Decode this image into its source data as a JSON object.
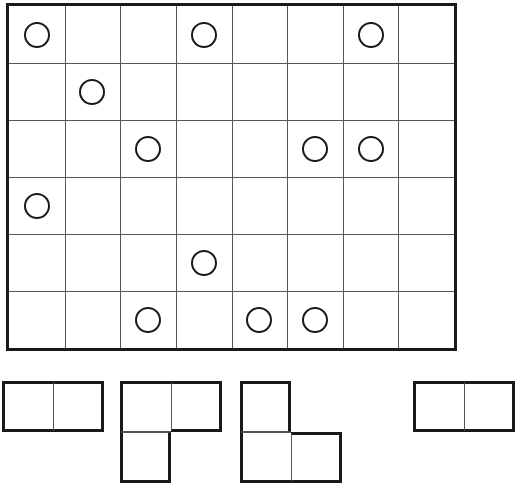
{
  "board": {
    "cols": 8,
    "rows": 6,
    "line_color": "#555555",
    "border_color": "#1a1a1a",
    "circles": [
      {
        "row": 0,
        "col": 0
      },
      {
        "row": 0,
        "col": 3
      },
      {
        "row": 0,
        "col": 6
      },
      {
        "row": 1,
        "col": 1
      },
      {
        "row": 2,
        "col": 2
      },
      {
        "row": 2,
        "col": 5
      },
      {
        "row": 2,
        "col": 6
      },
      {
        "row": 3,
        "col": 0
      },
      {
        "row": 4,
        "col": 3
      },
      {
        "row": 5,
        "col": 2
      },
      {
        "row": 5,
        "col": 4
      },
      {
        "row": 5,
        "col": 5
      }
    ]
  },
  "pieces": [
    {
      "name": "piece-1",
      "left": 2,
      "top": 381,
      "cells": [
        [
          0,
          0
        ],
        [
          0,
          1
        ]
      ]
    },
    {
      "name": "piece-2",
      "left": 120,
      "top": 381,
      "cells": [
        [
          0,
          0
        ],
        [
          1,
          0
        ],
        [
          0,
          1
        ]
      ]
    },
    {
      "name": "piece-3",
      "left": 240,
      "top": 381,
      "cells": [
        [
          0,
          0
        ],
        [
          1,
          0
        ],
        [
          1,
          1
        ]
      ]
    },
    {
      "name": "piece-4",
      "left": 413,
      "top": 381,
      "cells": [
        [
          0,
          0
        ],
        [
          0,
          1
        ]
      ]
    }
  ]
}
